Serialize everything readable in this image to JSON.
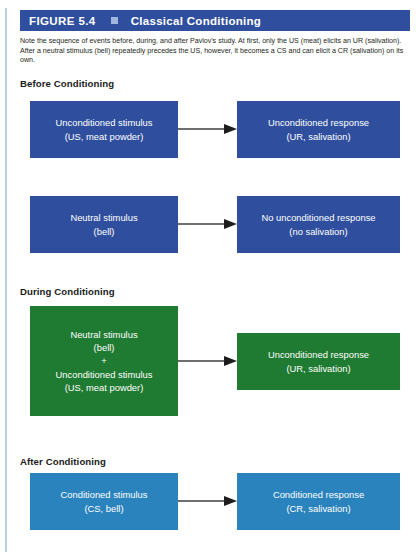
{
  "header": {
    "figure_label": "FIGURE 5.4",
    "separator_icon": "square-bullet-icon",
    "title": "Classical Conditioning",
    "bar_color": "#2f4f9e",
    "text_color": "#ffffff"
  },
  "caption": {
    "text": "Note the sequence of events before, during, and after Pavlov's study. At first, only the US (meat) elicits an UR (salivation). After a neutral stimulus (bell) repeatedly precedes the US, however, it becomes a CS and can elicit a CR (salivation) on its own."
  },
  "colors": {
    "blue_dark": "#2f4f9e",
    "green": "#1f7a32",
    "blue_light": "#2a83bd",
    "arrow": "#3f3f3f",
    "left_rule": "#b9cfe4"
  },
  "sections": [
    {
      "heading": "Before Conditioning",
      "rows": [
        {
          "source": {
            "line1": "Unconditioned stimulus",
            "line2": "(US, meat powder)",
            "color": "#2f4f9e"
          },
          "arrow": "arrow-right",
          "target": {
            "line1": "Unconditioned response",
            "line2": "(UR, salivation)",
            "color": "#2f4f9e"
          }
        },
        {
          "source": {
            "line1": "Neutral stimulus",
            "line2": "(bell)",
            "color": "#2f4f9e"
          },
          "arrow": "arrow-right",
          "target": {
            "line1": "No unconditioned response",
            "line2": "(no salivation)",
            "color": "#2f4f9e"
          }
        }
      ]
    },
    {
      "heading": "During Conditioning",
      "rows": [
        {
          "source": {
            "line1": "Neutral stimulus",
            "line2": "(bell)",
            "line3": "+",
            "line4": "Unconditioned stimulus",
            "line5": "(US, meat powder)",
            "color": "#1f7a32"
          },
          "arrow": "arrow-right",
          "target": {
            "line1": "Unconditioned response",
            "line2": "(UR, salivation)",
            "color": "#1f7a32"
          }
        }
      ]
    },
    {
      "heading": "After Conditioning",
      "rows": [
        {
          "source": {
            "line1": "Conditioned stimulus",
            "line2": "(CS, bell)",
            "color": "#2a83bd"
          },
          "arrow": "arrow-right",
          "target": {
            "line1": "Conditioned response",
            "line2": "(CR, salivation)",
            "color": "#2a83bd"
          }
        }
      ]
    }
  ]
}
